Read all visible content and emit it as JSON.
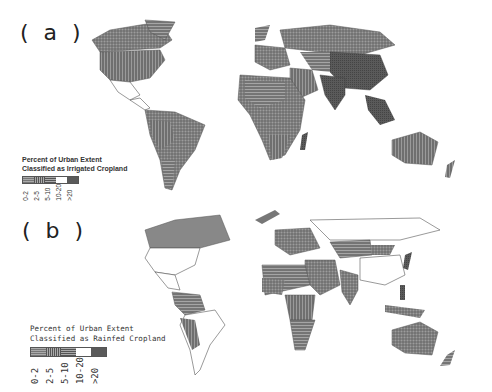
{
  "panels": [
    {
      "id": "a",
      "label": "( a )",
      "legend": {
        "title_line1": "Percent of Urban Extent",
        "title_line2": "Classified as Irrigated Cropland",
        "classes": [
          "0-2",
          "2-5",
          "5-10",
          "10-20",
          ">20"
        ],
        "swatch_fills": [
          "#9a9a9a",
          "#8a8a8a",
          "#7a7a7a",
          "#ffffff",
          "#5a5a5a"
        ]
      },
      "colors": {
        "land_fill": "#7a7a7a",
        "dark_fill": "#4f4f4f",
        "outline": "#555555"
      }
    },
    {
      "id": "b",
      "label": "( b )",
      "legend": {
        "title_line1": "Percent of Urban Extent",
        "title_line2": "Classified as Rainfed Cropland",
        "classes": [
          "0-2",
          "2-5",
          "5-10",
          "10-20",
          ">20"
        ],
        "swatch_fills": [
          "#9a9a9a",
          "#8a8a8a",
          "#7a7a7a",
          "#ffffff",
          "#5a5a5a"
        ]
      },
      "colors": {
        "land_fill": "#ffffff",
        "shaded_fill": "#888888",
        "outline": "#555555"
      }
    }
  ]
}
